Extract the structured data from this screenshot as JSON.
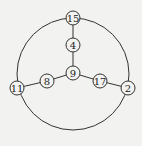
{
  "diagram": {
    "type": "graph",
    "outer_circle": {
      "cx": 73,
      "cy": 74,
      "r": 56
    },
    "nodes": [
      {
        "id": "15",
        "label": "15",
        "x": 73,
        "y": 18
      },
      {
        "id": "4",
        "label": "4",
        "x": 73,
        "y": 45
      },
      {
        "id": "9",
        "label": "9",
        "x": 73,
        "y": 73
      },
      {
        "id": "8",
        "label": "8",
        "x": 47,
        "y": 81
      },
      {
        "id": "11",
        "label": "11",
        "x": 17,
        "y": 88
      },
      {
        "id": "17",
        "label": "17",
        "x": 100,
        "y": 81
      },
      {
        "id": "2",
        "label": "2",
        "x": 128,
        "y": 88
      }
    ],
    "edges": [
      [
        "15",
        "4"
      ],
      [
        "4",
        "9"
      ],
      [
        "9",
        "8"
      ],
      [
        "8",
        "11"
      ],
      [
        "9",
        "17"
      ],
      [
        "17",
        "2"
      ]
    ],
    "colors": {
      "stroke": "#333333",
      "background": "#f2f2f0",
      "node_fill": "#f2f2f0"
    }
  }
}
